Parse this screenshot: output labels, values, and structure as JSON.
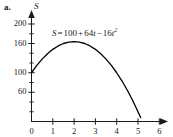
{
  "part_label": "a.",
  "equation": {
    "lhs": "S",
    "eq": "=",
    "c0": "100",
    "plus": "+",
    "c1": "64",
    "t1": "t",
    "minus": "−",
    "c2": "16",
    "t2": "t",
    "exp": "2",
    "full_text": "S = 100 + 64t − 16t²"
  },
  "chart_data": {
    "type": "line",
    "title": "",
    "subtitle": "",
    "xlabel": "",
    "ylabel": "S",
    "annotation": "S = 100 + 64t − 16t²",
    "function": "S(t) = 100 + 64t - 16t^2",
    "grid": false,
    "legend": false,
    "legend_position": "none",
    "xlim": [
      0,
      6
    ],
    "ylim": [
      0,
      220
    ],
    "x_ticks_major": [
      0,
      1,
      2,
      3,
      4,
      5,
      6
    ],
    "x_tick_labels": [
      "0",
      "1",
      "2",
      "3",
      "4",
      "5",
      "6"
    ],
    "y_ticks_labeled": [
      60,
      100,
      160,
      200
    ],
    "y_tick_labels": [
      "60",
      "100",
      "160",
      "200"
    ],
    "y_ticks_minor": [
      20,
      40,
      80,
      120,
      140,
      180
    ],
    "y_zero_label": "0",
    "x_axis_arrow": true,
    "y_axis_arrow": true,
    "line_color": "#000000",
    "axis_color": "#1a1a1a",
    "series": [
      {
        "name": "S(t)",
        "x": [
          0,
          0.25,
          0.5,
          0.75,
          1,
          1.25,
          1.5,
          1.75,
          2,
          2.25,
          2.5,
          2.75,
          3,
          3.25,
          3.5,
          3.75,
          4,
          4.25,
          4.5,
          4.75,
          5,
          5.125
        ],
        "values": [
          100,
          115,
          128,
          139,
          148,
          155,
          160,
          163,
          164,
          163,
          160,
          155,
          148,
          139,
          128,
          115,
          100,
          83,
          64,
          43,
          20,
          8
        ]
      }
    ],
    "key_points": {
      "y_intercept": 100,
      "vertex_t": 2,
      "vertex_S": 164,
      "t_intercept": 5.14
    }
  },
  "colors": {
    "background": "#ffffff",
    "ink": "#1a1a1a",
    "curve": "#000000"
  }
}
